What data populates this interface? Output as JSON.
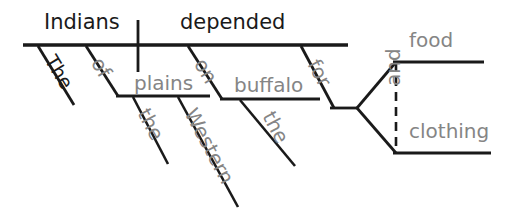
{
  "diagram": {
    "type": "reed-kellogg-sentence-diagram",
    "sentence": "The Indians of the Western plains depended on the buffalo for food and clothing.",
    "colors": {
      "background": "#ffffff",
      "line": "#1a1a1a",
      "main_text": "#1a1a1a",
      "modifier_text": "#858585"
    },
    "subject": {
      "word": "Indians"
    },
    "verb": {
      "word": "depended"
    },
    "subject_article": {
      "word": "The"
    },
    "prepositions": [
      {
        "word": "of",
        "object": "plains",
        "object_modifiers": [
          "the",
          "Western"
        ]
      },
      {
        "word": "on",
        "object": "buffalo",
        "object_modifiers": [
          "the"
        ]
      },
      {
        "word": "for",
        "object_compound": [
          "food",
          "clothing"
        ],
        "conjunction": "and"
      }
    ],
    "compound_object": {
      "conjunction": "and",
      "items": [
        "food",
        "clothing"
      ]
    },
    "labels": {
      "the_subject": "The",
      "indians": "Indians",
      "depended": "depended",
      "of": "of",
      "plains": "plains",
      "the_plains": "the",
      "western": "Western",
      "on": "on",
      "buffalo": "buffalo",
      "the_buffalo": "the",
      "for": "for",
      "and": "and",
      "food": "food",
      "clothing": "clothing"
    }
  }
}
